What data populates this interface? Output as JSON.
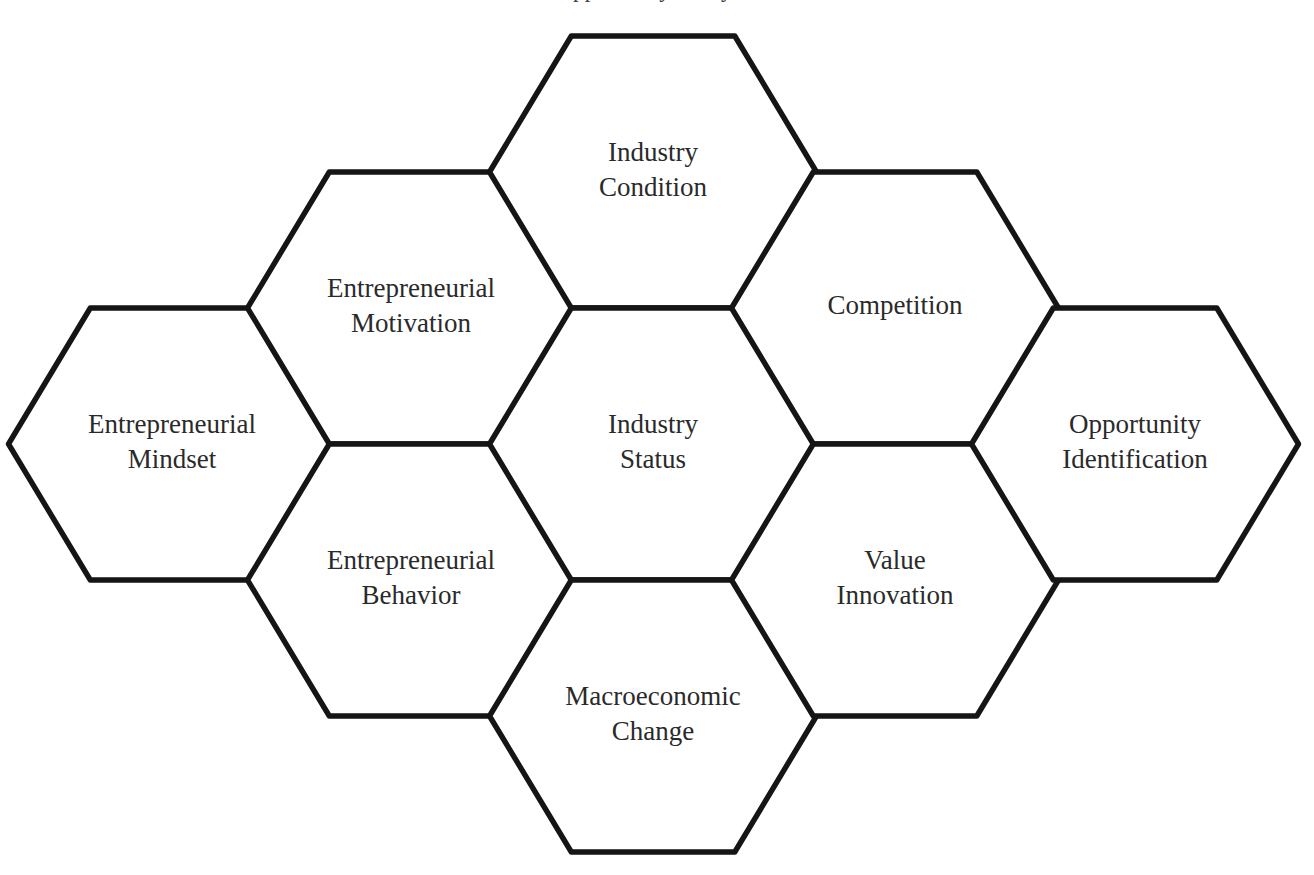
{
  "figure": {
    "title_cropped": "Opportunity Analysis",
    "background_color": "#ffffff",
    "stroke_color": "#151515",
    "label_color": "#2a2a2a",
    "layout": "honeycomb",
    "hex_width": 327,
    "hex_height": 272
  },
  "chart_data": {
    "type": "diagram",
    "title": "Opportunity Analysis",
    "shape": "flat-top-hexagon-honeycomb",
    "columns": 5,
    "cells": [
      {
        "id": "entrepreneurial-mindset",
        "lines": [
          "Entrepreneurial",
          "Mindset"
        ],
        "cx": 172,
        "cy": 444,
        "col": 0,
        "row": 1
      },
      {
        "id": "entrepreneurial-motivation",
        "lines": [
          "Entrepreneurial",
          "Motivation"
        ],
        "cx": 411,
        "cy": 308,
        "col": 1,
        "row": 0
      },
      {
        "id": "entrepreneurial-behavior",
        "lines": [
          "Entrepreneurial",
          "Behavior"
        ],
        "cx": 411,
        "cy": 580,
        "col": 1,
        "row": 2
      },
      {
        "id": "industry-condition",
        "lines": [
          "Industry",
          "Condition"
        ],
        "cx": 653,
        "cy": 172,
        "col": 2,
        "row": -1
      },
      {
        "id": "industry-status",
        "lines": [
          "Industry",
          "Status"
        ],
        "cx": 653,
        "cy": 444,
        "col": 2,
        "row": 1
      },
      {
        "id": "macroeconomic-change",
        "lines": [
          "Macroeconomic",
          "Change"
        ],
        "cx": 653,
        "cy": 716,
        "col": 2,
        "row": 3
      },
      {
        "id": "competition",
        "lines": [
          "Competition"
        ],
        "cx": 895,
        "cy": 308,
        "col": 3,
        "row": 0
      },
      {
        "id": "value-innovation",
        "lines": [
          "Value",
          "Innovation"
        ],
        "cx": 895,
        "cy": 580,
        "col": 3,
        "row": 2
      },
      {
        "id": "opportunity-identification",
        "lines": [
          "Opportunity",
          "Identification"
        ],
        "cx": 1135,
        "cy": 444,
        "col": 4,
        "row": 1
      }
    ]
  }
}
